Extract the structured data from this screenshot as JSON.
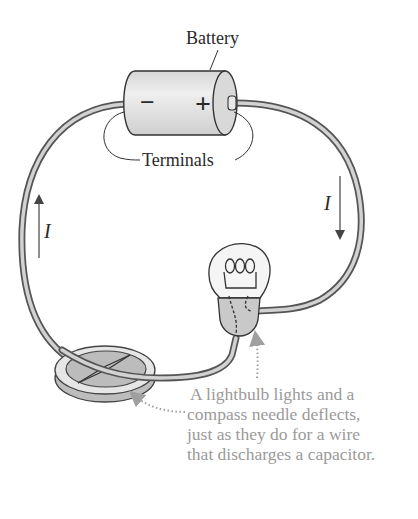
{
  "diagram": {
    "labels": {
      "battery": "Battery",
      "terminals": "Terminals",
      "negative": "−",
      "positive": "+",
      "current_left": "I",
      "current_right": "I"
    },
    "caption_lines": [
      "A lightbulb lights and a",
      "compass needle deflects,",
      "just as they do for a wire",
      "that discharges a capacitor."
    ],
    "colors": {
      "wire_outline": "#555555",
      "wire_fill": "#cfcfcf",
      "battery_fill": "#e3e3e3",
      "bulb_base": "#c9c9c9",
      "caption": "#9a9a9a",
      "pointer": "#a0a0a0"
    }
  }
}
